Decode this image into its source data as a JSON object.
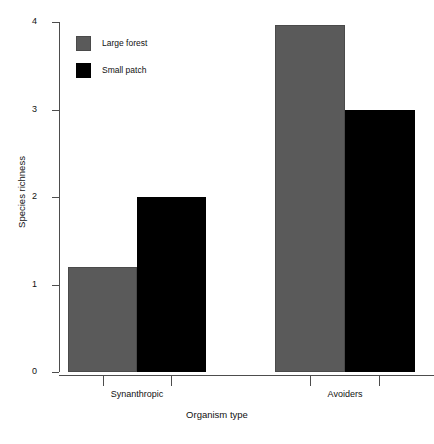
{
  "chart_data": {
    "type": "bar",
    "title": "",
    "subtitle": "",
    "xlabel": "Organism type",
    "ylabel": "Species richness",
    "categories": [
      "Synanthropic",
      "Avoiders"
    ],
    "series": [
      {
        "name": "Large forest",
        "color": "#5a5a5a",
        "values": [
          1.2,
          3.97
        ]
      },
      {
        "name": "Small patch",
        "color": "#000000",
        "values": [
          2.0,
          3.0
        ]
      }
    ],
    "ylim": [
      0,
      4
    ],
    "yticks": [
      0,
      1,
      2,
      3,
      4
    ],
    "ytick_labels": [
      "0",
      "1",
      "2",
      "3",
      "4"
    ],
    "grid": false,
    "legend_position": "top-left-inside",
    "bar_style": "adjacent-grouped",
    "background": "#ffffff",
    "axis_color": "#4d4d4d"
  },
  "axes": {
    "y_title": "Species richness",
    "x_title": "Organism type",
    "y_ticks": [
      {
        "value": 4,
        "label": "4"
      },
      {
        "value": 3,
        "label": "3"
      },
      {
        "value": 2,
        "label": "2"
      },
      {
        "value": 1,
        "label": "1"
      },
      {
        "value": 0,
        "label": "0"
      }
    ],
    "x_groups": [
      {
        "label": "Synanthropic"
      },
      {
        "label": "Avoiders"
      }
    ]
  },
  "legend": {
    "items": [
      {
        "label": "Large forest",
        "color": "#5a5a5a"
      },
      {
        "label": "Small patch",
        "color": "#000000"
      }
    ]
  }
}
